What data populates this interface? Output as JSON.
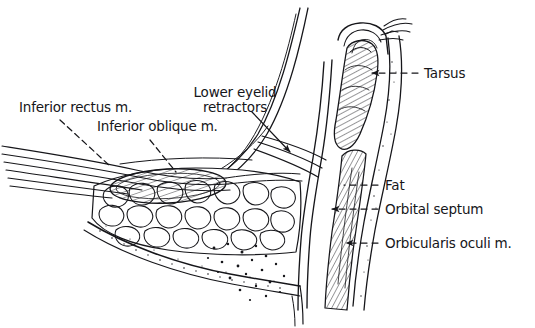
{
  "figure": {
    "background_color": "#ffffff",
    "ink_color": "#16161a",
    "width": 535,
    "height": 328
  },
  "labels": {
    "inferior_rectus": "Inferior rectus m.",
    "inferior_oblique": "Inferior oblique m.",
    "lower_eyelid_retractors_line1": "Lower eyelid",
    "lower_eyelid_retractors_line2": "retractors",
    "tarsus": "Tarsus",
    "fat": "Fat",
    "orbital_septum": "Orbital septum",
    "orbicularis_oculi": "Orbicularis oculi m."
  },
  "leader_lines": {
    "inferior_rectus": {
      "style": "dashed",
      "terminator": "none"
    },
    "inferior_oblique": {
      "style": "dashed",
      "terminator": "none"
    },
    "lower_eyelid_retractors": {
      "style": "solid",
      "terminator": "arrowhead"
    },
    "tarsus": {
      "style": "dashed",
      "terminator": "arrowhead"
    },
    "fat": {
      "style": "dashed",
      "terminator": "none"
    },
    "orbital_septum": {
      "style": "dashed",
      "terminator": "arrowhead"
    },
    "orbicularis_oculi": {
      "style": "dashed",
      "terminator": "arrowhead"
    }
  },
  "structures": [
    {
      "name": "eyelid-margin",
      "description": "lid margin with eyelashes at top"
    },
    {
      "name": "tarsal-plate",
      "description": "hatched tarsal plate in the lid"
    },
    {
      "name": "orbicularis-oculi-muscle",
      "description": "hatched muscle band anterior to septum"
    },
    {
      "name": "orbital-septum",
      "description": "membrane separating fat from lid"
    },
    {
      "name": "orbital-fat-pad",
      "description": "lobulated fat filling the inferior orbit"
    },
    {
      "name": "inferior-oblique-muscle",
      "description": "cross-sectioned muscle belly in fat"
    },
    {
      "name": "inferior-rectus-muscle",
      "description": "striated muscle entering from the left"
    },
    {
      "name": "orbital-rim-bone",
      "description": "stippled bone at inferior orbital rim"
    },
    {
      "name": "globe-contour",
      "description": "curved line of the eyeball above"
    }
  ]
}
